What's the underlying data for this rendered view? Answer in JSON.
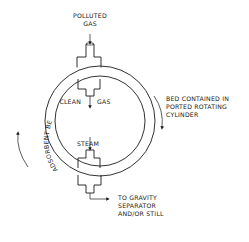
{
  "diagram": {
    "type": "rotating adsorbent bed schematic",
    "labels": {
      "inlet_line1": "POLLUTED",
      "inlet_line2": "GAS",
      "clean_left": "CLEAN",
      "clean_right": "GAS",
      "steam": "STEAM",
      "bed_line1": "BED CONTAINED IN",
      "bed_line2": "PORTED ROTATING",
      "bed_line3": "CYLINDER",
      "outlet_line1": "TO GRAVITY",
      "outlet_line2": "SEPARATOR",
      "outlet_line3": "AND/OR STILL",
      "ring_label": "ADSORBENT BED"
    },
    "icons": {
      "inlet_arrow": "arrow-down",
      "clean_arrow": "arrow-down",
      "steam_arrow": "arrow-down",
      "outlet_arrow": "arrow-right",
      "rotation_right": "curved-arrow-clockwise",
      "rotation_left": "curved-arrow-up"
    },
    "colors": {
      "line": "#1a1a1a",
      "background": "#ffffff"
    }
  }
}
